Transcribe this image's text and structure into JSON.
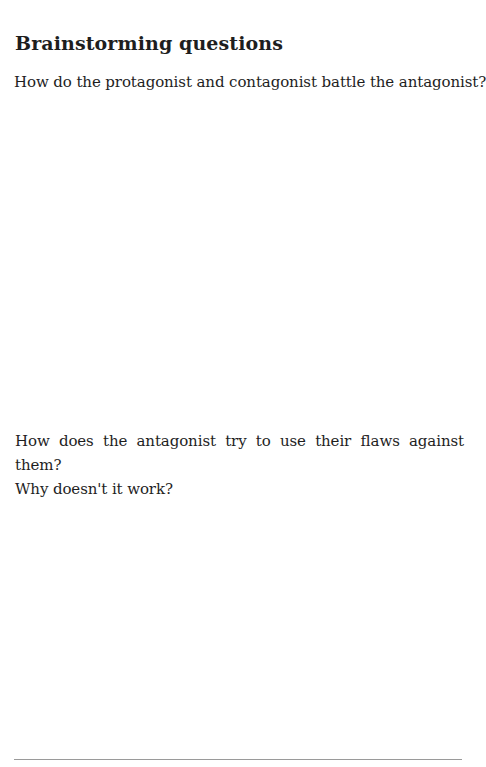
{
  "section": {
    "heading": "Brainstorming questions",
    "questions": [
      {
        "text": "How do the protagonist and contagonist battle the antagonist?"
      },
      {
        "line1": "How does the antagonist try to use their flaws against them?",
        "line2": "Why doesn't it work?"
      }
    ]
  }
}
